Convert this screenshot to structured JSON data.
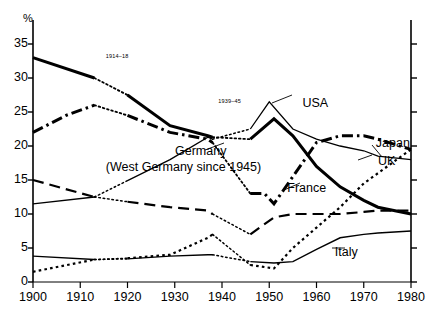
{
  "chart": {
    "y_unit": "%",
    "y_ticks": [
      0,
      5,
      10,
      15,
      20,
      25,
      30,
      35
    ],
    "x_ticks": [
      1900,
      1910,
      1920,
      1930,
      1940,
      1950,
      1960,
      1970,
      1980
    ],
    "annotations": [
      {
        "name": "wwi-label",
        "text": "1914–18",
        "x": 0.245,
        "y": 0.165
      },
      {
        "name": "wwii-label",
        "text": "1939–45",
        "x": 0.505,
        "y": 0.305
      }
    ],
    "series_labels": [
      {
        "name": "label-usa",
        "text": "USA",
        "x": 0.7,
        "y": 0.3
      },
      {
        "name": "label-japan",
        "text": "Japan",
        "x": 0.87,
        "y": 0.425
      },
      {
        "name": "label-uk",
        "text": "UK",
        "x": 0.875,
        "y": 0.48
      },
      {
        "name": "label-germany",
        "text": "Germany",
        "x": 0.405,
        "y": 0.45
      },
      {
        "name": "label-germany-note",
        "text": "(West Germany since 1945)",
        "x": 0.245,
        "y": 0.5
      },
      {
        "name": "label-france",
        "text": "France",
        "x": 0.665,
        "y": 0.565
      },
      {
        "name": "label-italy",
        "text": "Italy",
        "x": 0.775,
        "y": 0.765
      }
    ]
  },
  "chart_data": {
    "type": "line",
    "title": "",
    "subtitle": "",
    "xlabel": "",
    "ylabel": "%",
    "xlim": [
      1900,
      1980
    ],
    "ylim": [
      0,
      36
    ],
    "grid": false,
    "legend": "inline-annotations",
    "xticks": [
      1900,
      1910,
      1920,
      1930,
      1940,
      1950,
      1960,
      1970,
      1980
    ],
    "yticks": [
      0,
      5,
      10,
      15,
      20,
      25,
      30,
      35
    ],
    "war_periods": [
      {
        "label": "1914–18",
        "start": 1913,
        "end": 1920
      },
      {
        "label": "1939–45",
        "start": 1938,
        "end": 1946
      }
    ],
    "series": [
      {
        "name": "UK",
        "style": "thick-solid",
        "x": [
          1900,
          1913,
          1920,
          1929,
          1937,
          1938,
          1946,
          1951,
          1955,
          1960,
          1965,
          1970,
          1973,
          1980
        ],
        "values": [
          33.0,
          30.0,
          27.5,
          23.0,
          21.5,
          21.3,
          21.0,
          24.0,
          21.5,
          17.0,
          14.0,
          12.0,
          11.0,
          10.0
        ]
      },
      {
        "name": "USA",
        "style": "thin-solid",
        "x": [
          1900,
          1913,
          1929,
          1937,
          1938,
          1946,
          1950,
          1955,
          1960,
          1965,
          1970,
          1973,
          1980
        ],
        "values": [
          11.5,
          12.5,
          18.0,
          21.3,
          21.0,
          22.5,
          26.5,
          22.5,
          21.0,
          20.0,
          19.3,
          18.5,
          18.0
        ]
      },
      {
        "name": "Germany (West Germany since 1945)",
        "style": "thick-dash-dot",
        "x": [
          1900,
          1907,
          1913,
          1920,
          1929,
          1937,
          1938,
          1946,
          1949,
          1951,
          1955,
          1960,
          1965,
          1970,
          1973,
          1980
        ],
        "values": [
          22.0,
          24.5,
          26.0,
          24.5,
          22.0,
          21.0,
          20.5,
          13.0,
          13.0,
          11.5,
          15.5,
          20.5,
          21.5,
          21.5,
          21.0,
          19.5
        ]
      },
      {
        "name": "France",
        "style": "long-dash",
        "x": [
          1900,
          1913,
          1920,
          1929,
          1937,
          1938,
          1946,
          1951,
          1955,
          1960,
          1965,
          1970,
          1973,
          1980
        ],
        "values": [
          15.0,
          12.5,
          11.8,
          11.0,
          10.5,
          10.0,
          7.0,
          9.5,
          10.0,
          10.0,
          10.0,
          10.3,
          10.5,
          10.5
        ]
      },
      {
        "name": "Japan",
        "style": "fine-dot",
        "x": [
          1900,
          1913,
          1920,
          1929,
          1937,
          1938,
          1946,
          1951,
          1955,
          1960,
          1965,
          1970,
          1973,
          1980
        ],
        "values": [
          1.5,
          3.3,
          3.5,
          4.0,
          6.5,
          7.0,
          2.5,
          2.0,
          5.0,
          8.0,
          11.0,
          14.5,
          16.0,
          19.5
        ]
      },
      {
        "name": "Italy",
        "style": "thin-solid-low",
        "x": [
          1900,
          1913,
          1920,
          1929,
          1937,
          1938,
          1946,
          1951,
          1955,
          1960,
          1965,
          1970,
          1973,
          1980
        ],
        "values": [
          3.8,
          3.3,
          3.4,
          3.8,
          4.0,
          4.0,
          3.0,
          2.8,
          3.0,
          4.8,
          6.5,
          7.0,
          7.2,
          7.5
        ]
      }
    ]
  }
}
